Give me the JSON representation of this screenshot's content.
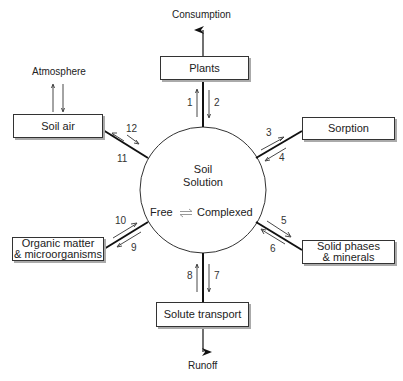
{
  "diagram": {
    "center": {
      "title_line1": "Soil",
      "title_line2": "Solution",
      "free": "Free",
      "equilibrium_symbol": "⇌",
      "complexed": "Complexed"
    },
    "nodes": {
      "plants": "Plants",
      "soil_air": "Soil air",
      "sorption": "Sorption",
      "solid_phases_line1": "Solid phases",
      "solid_phases_line2": "& minerals",
      "organic_line1": "Organic matter",
      "organic_line2": "& microorganisms",
      "solute_transport": "Solute transport"
    },
    "external": {
      "consumption": "Consumption",
      "atmosphere": "Atmosphere",
      "runoff": "Runoff"
    },
    "flows": {
      "f1": "1",
      "f2": "2",
      "f3": "3",
      "f4": "4",
      "f5": "5",
      "f6": "6",
      "f7": "7",
      "f8": "8",
      "f9": "9",
      "f10": "10",
      "f11": "11",
      "f12": "12"
    }
  }
}
